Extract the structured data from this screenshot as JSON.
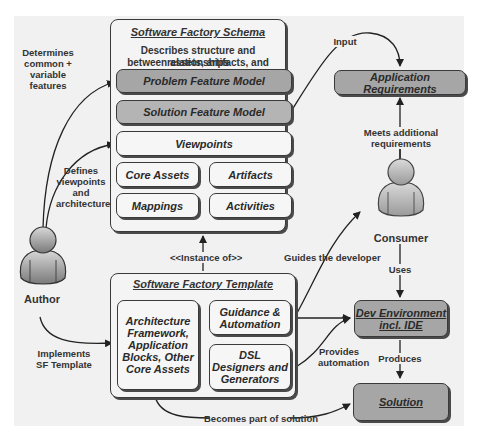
{
  "schema": {
    "title": "Software Factory Schema",
    "description_line1": "Describes structure and relationships",
    "description_line2": "between assets, artifacts, and activities",
    "problem_feature_model": "Problem Feature Model",
    "solution_feature_model": "Solution Feature Model",
    "viewpoints": "Viewpoints",
    "core_assets": "Core Assets",
    "artifacts": "Artifacts",
    "mappings": "Mappings",
    "activities": "Activities"
  },
  "template": {
    "title": "Software Factory Template",
    "core_assets_line1": "Architecture",
    "core_assets_line2": "Framework,",
    "core_assets_line3": "Application",
    "core_assets_line4": "Blocks, Other",
    "core_assets_line5": "Core Assets",
    "guidance_line1": "Guidance &",
    "guidance_line2": "Automation",
    "dsl_line1": "DSL",
    "dsl_line2": "Designers and",
    "dsl_line3": "Generators"
  },
  "right": {
    "application_requirements": "Application Requirements",
    "dev_environment_line1": "Dev Environment",
    "dev_environment_line2": "incl. IDE",
    "solution": "Solution"
  },
  "actors": {
    "author": "Author",
    "consumer": "Consumer"
  },
  "edge_labels": {
    "determines_line1": "Determines",
    "determines_line2": "common +",
    "determines_line3": "variable",
    "determines_line4": "features",
    "defines_line1": "Defines",
    "defines_line2": "viewpoints",
    "defines_line3": "and",
    "defines_line4": "architecture",
    "implements_line1": "Implements",
    "implements_line2": "SF Template",
    "instance_of": "<<Instance of>>",
    "input": "Input",
    "meets_line1": "Meets additional",
    "meets_line2": "requirements",
    "guides": "Guides the developer",
    "uses": "Uses",
    "provides_line1": "Provides",
    "provides_line2": "automation",
    "produces": "Produces",
    "becomes": "Becomes part of solution"
  },
  "colors": {
    "panel_bg": "#f1f1f1",
    "dark_box": "#a6a6a6",
    "mid_box": "#b4b4b4",
    "light_box": "#f6f6f6",
    "stroke": "#3a3a3a"
  }
}
